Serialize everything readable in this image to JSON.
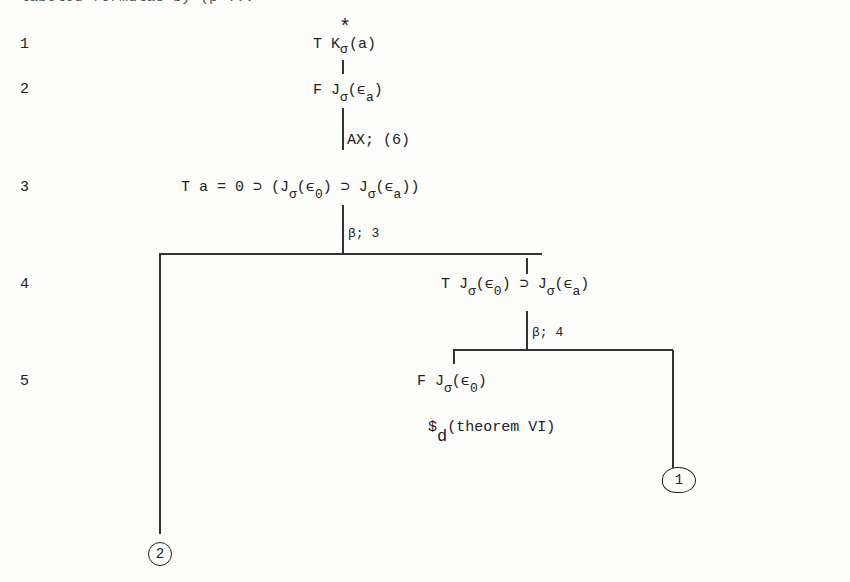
{
  "header_cut_text": "labeled formulas by (p ...",
  "line_numbers": [
    "1",
    "2",
    "3",
    "4",
    "5"
  ],
  "nodes": {
    "n1": {
      "sign": "T",
      "pre": "K",
      "sub": "σ",
      "sup": "*",
      "post": "(a)"
    },
    "n2": {
      "sign": "F",
      "pre": "J",
      "sub": "σ",
      "arg_pre": "(ϵ",
      "arg_sub": "a",
      "arg_post": ")"
    },
    "rule2": "AX; (6)",
    "n3": {
      "text_a": "T a = 0 ⊃ (J",
      "s1": "σ",
      "t2": "(ϵ",
      "s2": "0",
      "t3": ") ⊃ J",
      "s3": "σ",
      "t4": "(ϵ",
      "s4": "a",
      "t5": "))"
    },
    "rule3": "β; 3",
    "n4": {
      "text_a": "T J",
      "s1": "σ",
      "t2": "(ϵ",
      "s2": "0",
      "t3": ") ⊃ J",
      "s3": "σ",
      "t4": "(ϵ",
      "s4": "a",
      "t5": ")"
    },
    "rule4": "β; 4",
    "n5": {
      "sign": "F",
      "pre": "J",
      "sub": "σ",
      "arg_pre": "(ϵ",
      "arg_sub": "0",
      "arg_post": ")"
    },
    "closure": {
      "mark": "$",
      "sub": "d",
      "text": "(theorem VI)"
    }
  },
  "leaves": {
    "right": "1",
    "left": "2"
  }
}
